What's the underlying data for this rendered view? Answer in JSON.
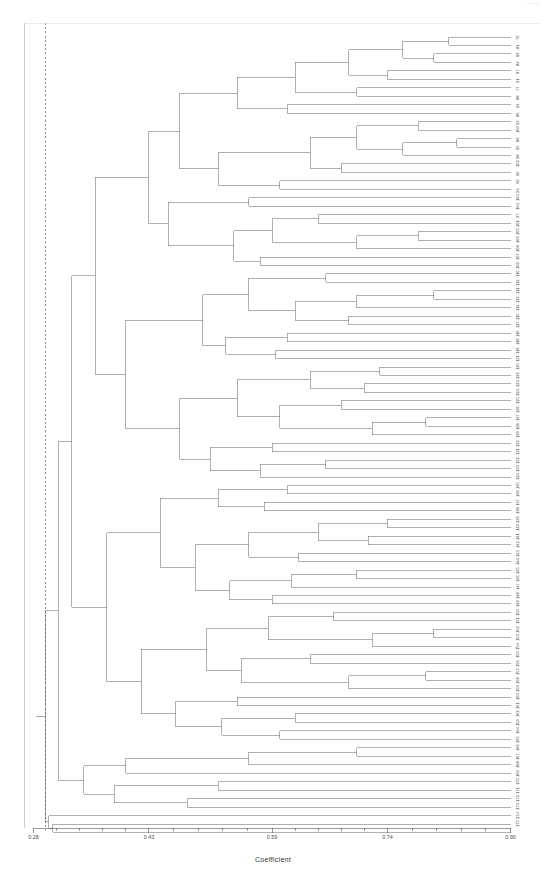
{
  "header": {
    "corner_note": "— — —"
  },
  "axis": {
    "title": "Coefficient",
    "ticks": [
      {
        "label": "0.28",
        "value": 0.28
      },
      {
        "label": "0.43",
        "value": 0.43
      },
      {
        "label": "0.59",
        "value": 0.59
      },
      {
        "label": "0.74",
        "value": 0.74
      },
      {
        "label": "0.90",
        "value": 0.9
      }
    ],
    "minor_ticks_per_interval": 4,
    "cut_line_value": 0.295
  },
  "chart_data": {
    "type": "dendrogram",
    "title": "",
    "xlabel": "Coefficient",
    "ylabel": "",
    "xlim": [
      0.28,
      0.9
    ],
    "grid": false,
    "legend": null,
    "orientation": "horizontal-right-leaves",
    "linkage_note": "agglomerative similarity dendrogram; similarity increases to the right",
    "n_leaves": 95,
    "leaf_labels": [
      "79",
      "81",
      "82",
      "84",
      "87",
      "91",
      "77",
      "88",
      "94",
      "86",
      "92",
      "100",
      "89",
      "95",
      "98",
      "102",
      "96",
      "99",
      "93",
      "103",
      "104",
      "97",
      "101",
      "105",
      "106",
      "108",
      "107",
      "109",
      "110",
      "112",
      "111",
      "113",
      "114",
      "115",
      "117",
      "116",
      "118",
      "119",
      "121",
      "120",
      "122",
      "123",
      "124",
      "125",
      "126",
      "127",
      "128",
      "129",
      "130",
      "131",
      "132",
      "133",
      "134",
      "135",
      "136",
      "137",
      "138",
      "139",
      "140",
      "141",
      "142",
      "143",
      "144",
      "145",
      "146",
      "147",
      "148",
      "149",
      "150",
      "151",
      "152",
      "153",
      "154",
      "155",
      "156",
      "157",
      "158",
      "159",
      "160",
      "161",
      "162",
      "163",
      "164",
      "165",
      "166",
      "167",
      "168",
      "169",
      "170",
      "171",
      "172",
      "173",
      "174",
      "175"
    ],
    "merges": [
      {
        "height": 0.88,
        "note": "terminal pair fusions near right edge"
      },
      {
        "height": 0.84,
        "note": "tight sub-cluster fusions"
      },
      {
        "height": 0.78,
        "note": "small group fusions"
      },
      {
        "height": 0.7,
        "note": "mid-level group fusions"
      },
      {
        "height": 0.62,
        "note": "cluster-level fusions"
      },
      {
        "height": 0.52,
        "note": "major sub-branch joins"
      },
      {
        "height": 0.44,
        "note": "upper super-cluster join"
      },
      {
        "height": 0.38,
        "note": "lower super-cluster join"
      },
      {
        "height": 0.33,
        "note": "near-root joins"
      },
      {
        "height": 0.295,
        "note": "root fusion of all objects"
      }
    ],
    "cut_line": {
      "value": 0.295,
      "style": "dashed",
      "orientation": "vertical"
    }
  }
}
